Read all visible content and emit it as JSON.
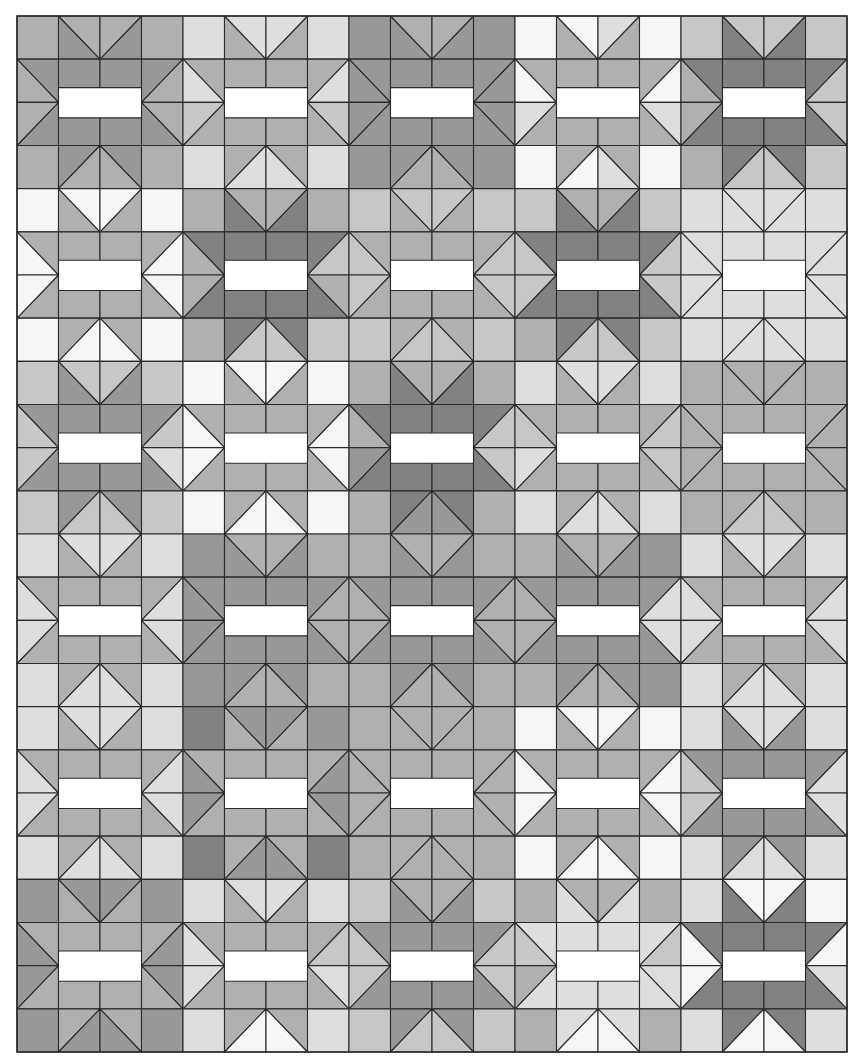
{
  "quilt": {
    "title": "Sawtooth star quilt pattern",
    "cols": 20,
    "rows": 24,
    "origin": [
      17,
      16
    ],
    "size": [
      830,
      1036
    ],
    "line_color": "#2a2a2a",
    "rect_color": "#ffffff",
    "shades": [
      "#f6f6f6",
      "#dedede",
      "#c7c7c7",
      "#b0b0b0",
      "#989898",
      "#828282"
    ],
    "stars": [
      [
        4,
        3,
        4,
        3,
        5
      ],
      [
        3,
        5,
        3,
        5,
        1
      ],
      [
        4,
        3,
        5,
        3,
        3
      ],
      [
        3,
        4,
        4,
        4,
        3
      ],
      [
        3,
        3,
        3,
        3,
        4
      ],
      [
        3,
        3,
        4,
        1,
        5
      ]
    ],
    "background": [
      "33331111433400102222",
      "3--31--14--40--03--2",
      "3--32--24--41--13--2",
      "33331111433400103222",
      "00003333222223321111",
      "0--03--22--22--21--1",
      "0--03--32--22--21--1",
      "00003222222232221111",
      "22220000333311113333",
      "2--20--03--22--23--3",
      "2--10--04--21--23--3",
      "22220000344311113223",
      "11114333333333341111",
      "1--14--33--33--11--1",
      "1--14--33--33--11--1",
      "11114333333333341111",
      "11115444333300001111",
      "1--14--43--30--02--1",
      "1--14--43--30--02--1",
      "11115445333300001111",
      "44441111233233331000",
      "4--41--22--22--20--0",
      "4--41--12--23--10--1",
      "44441001222230031001"
    ]
  }
}
